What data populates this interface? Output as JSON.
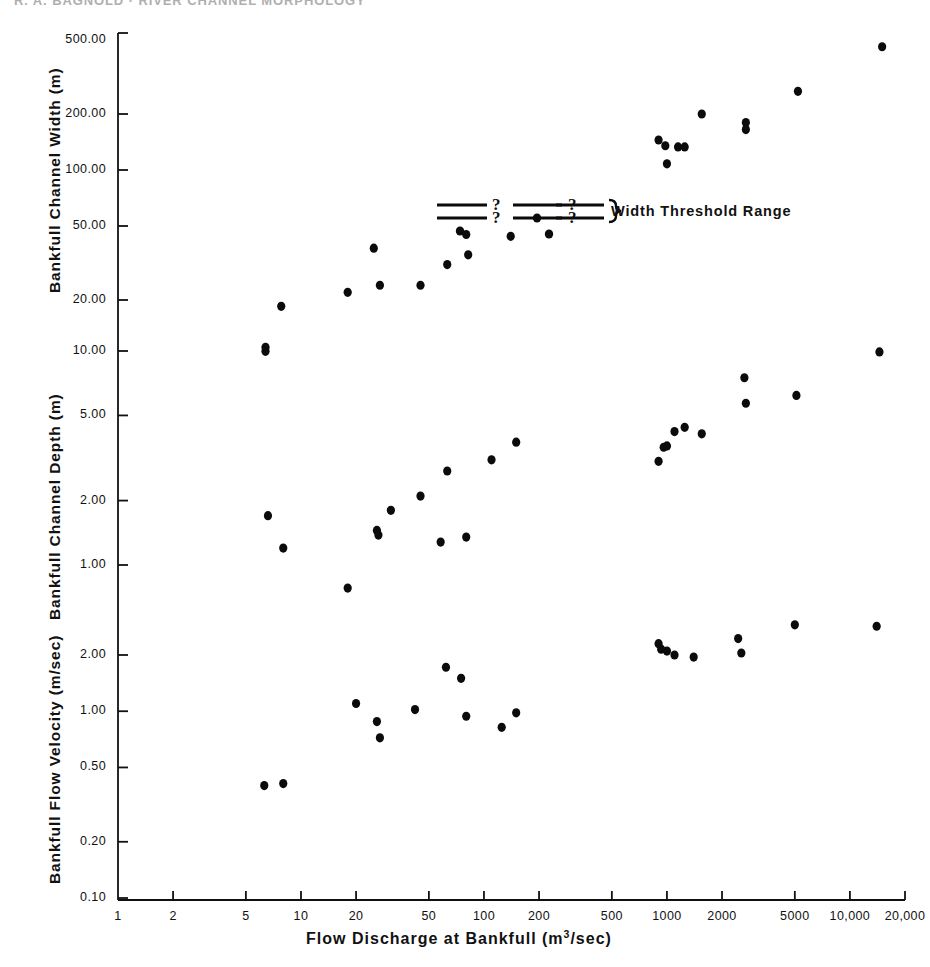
{
  "running_head": "R. A. BAGNOLD   ·   RIVER CHANNEL MORPHOLOGY",
  "figure": {
    "x_axis": {
      "title_main": "Flow Discharge at Bankfull (m",
      "title_sup": "3",
      "title_tail": "/sec)",
      "scale": "log",
      "ticks": [
        "1",
        "2",
        "5",
        "10",
        "20",
        "50",
        "100",
        "200",
        "500",
        "1000",
        "2000",
        "5000",
        "10,000",
        "20,000"
      ],
      "tick_values": [
        1,
        2,
        5,
        10,
        20,
        50,
        100,
        200,
        500,
        1000,
        2000,
        5000,
        10000,
        20000
      ],
      "range": [
        1,
        20000
      ]
    },
    "panels": [
      {
        "id": "width",
        "ylabel": "Bankfull Channel Width (m)",
        "yticks": [
          "500.00",
          "200.00",
          "100.00",
          "50.00",
          "20.00"
        ],
        "ytick_values": [
          500,
          200,
          100,
          50,
          20
        ]
      },
      {
        "id": "depth",
        "ylabel": "Bankfull Channel Depth (m)",
        "yticks": [
          "10.00",
          "5.00",
          "2.00",
          "1.00"
        ],
        "ytick_values": [
          10,
          5,
          2,
          1
        ]
      },
      {
        "id": "velocity",
        "ylabel": "Bankfull Flow Velocity (m/sec)",
        "yticks": [
          "2.00",
          "1.00",
          "0.50",
          "0.20",
          "0.10"
        ],
        "ytick_values": [
          2,
          1,
          0.5,
          0.2,
          0.1
        ]
      }
    ],
    "annotation": {
      "label": "Width Threshold Range",
      "question_marks": [
        "?",
        "?",
        "?",
        "?"
      ],
      "brace": "}"
    }
  },
  "chart_data": {
    "type": "scatter",
    "title": "",
    "xlabel": "Flow Discharge at Bankfull (m3/sec)",
    "xscale": "log",
    "xlim": [
      1,
      20000
    ],
    "grid": false,
    "legend": "none",
    "panels": [
      {
        "name": "Bankfull Channel Width (m)",
        "ylabel": "Bankfull Channel Width (m)",
        "yscale": "log",
        "ylim": [
          20,
          500
        ],
        "yticks": [
          500,
          200,
          100,
          50,
          20
        ],
        "points": [
          {
            "x": 6.4,
            "y": 10.6
          },
          {
            "x": 7.8,
            "y": 18.5
          },
          {
            "x": 18.0,
            "y": 22.0
          },
          {
            "x": 25.0,
            "y": 38.0
          },
          {
            "x": 27.0,
            "y": 24.0
          },
          {
            "x": 45.0,
            "y": 24.0
          },
          {
            "x": 63.0,
            "y": 31.0
          },
          {
            "x": 80.0,
            "y": 45.0
          },
          {
            "x": 82.0,
            "y": 35.0
          },
          {
            "x": 140.0,
            "y": 44.0
          },
          {
            "x": 900.0,
            "y": 145.0
          },
          {
            "x": 980.0,
            "y": 135.0
          },
          {
            "x": 1000.0,
            "y": 108.0
          },
          {
            "x": 1150.0,
            "y": 133.0
          },
          {
            "x": 1250.0,
            "y": 133.0
          },
          {
            "x": 1550.0,
            "y": 200.0
          },
          {
            "x": 2700.0,
            "y": 180.0
          },
          {
            "x": 2700.0,
            "y": 165.0
          },
          {
            "x": 5200.0,
            "y": 265.0
          },
          {
            "x": 15000.0,
            "y": 460.0
          }
        ]
      },
      {
        "name": "Bankfull Channel Depth (m)",
        "ylabel": "Bankfull Channel Depth (m)",
        "yscale": "log",
        "ylim": [
          0.6,
          12
        ],
        "yticks": [
          10,
          5,
          2,
          1
        ],
        "points": [
          {
            "x": 6.4,
            "y": 10.4
          },
          {
            "x": 6.6,
            "y": 1.7
          },
          {
            "x": 8.0,
            "y": 1.2
          },
          {
            "x": 18.0,
            "y": 0.78
          },
          {
            "x": 26.0,
            "y": 1.45
          },
          {
            "x": 26.5,
            "y": 1.38
          },
          {
            "x": 31.0,
            "y": 1.8
          },
          {
            "x": 45.0,
            "y": 2.1
          },
          {
            "x": 58.0,
            "y": 1.28
          },
          {
            "x": 63.0,
            "y": 2.75
          },
          {
            "x": 80.0,
            "y": 1.35
          },
          {
            "x": 110.0,
            "y": 3.1
          },
          {
            "x": 150.0,
            "y": 3.75
          },
          {
            "x": 900.0,
            "y": 3.05
          },
          {
            "x": 960.0,
            "y": 3.55
          },
          {
            "x": 1000.0,
            "y": 3.6
          },
          {
            "x": 1100.0,
            "y": 4.2
          },
          {
            "x": 1250.0,
            "y": 4.4
          },
          {
            "x": 1550.0,
            "y": 4.1
          },
          {
            "x": 2650.0,
            "y": 7.5
          },
          {
            "x": 2700.0,
            "y": 5.7
          },
          {
            "x": 5100.0,
            "y": 6.2
          },
          {
            "x": 14500.0,
            "y": 9.9
          }
        ]
      },
      {
        "name": "Bankfull Flow Velocity (m/sec)",
        "ylabel": "Bankfull Flow Velocity (m/sec)",
        "yscale": "log",
        "ylim": [
          0.1,
          4
        ],
        "yticks": [
          2,
          1,
          0.5,
          0.2,
          0.1
        ],
        "points": [
          {
            "x": 6.3,
            "y": 0.4
          },
          {
            "x": 8.0,
            "y": 0.41
          },
          {
            "x": 20.0,
            "y": 1.1
          },
          {
            "x": 26.0,
            "y": 0.88
          },
          {
            "x": 27.0,
            "y": 0.72
          },
          {
            "x": 42.0,
            "y": 1.02
          },
          {
            "x": 62.0,
            "y": 1.72
          },
          {
            "x": 75.0,
            "y": 1.5
          },
          {
            "x": 80.0,
            "y": 0.94
          },
          {
            "x": 125.0,
            "y": 0.82
          },
          {
            "x": 150.0,
            "y": 0.98
          },
          {
            "x": 900.0,
            "y": 2.3
          },
          {
            "x": 930.0,
            "y": 2.15
          },
          {
            "x": 1000.0,
            "y": 2.1
          },
          {
            "x": 1100.0,
            "y": 2.0
          },
          {
            "x": 1400.0,
            "y": 1.95
          },
          {
            "x": 2450.0,
            "y": 2.45
          },
          {
            "x": 2550.0,
            "y": 2.05
          },
          {
            "x": 5000.0,
            "y": 2.9
          },
          {
            "x": 14000.0,
            "y": 2.85
          }
        ]
      }
    ]
  }
}
